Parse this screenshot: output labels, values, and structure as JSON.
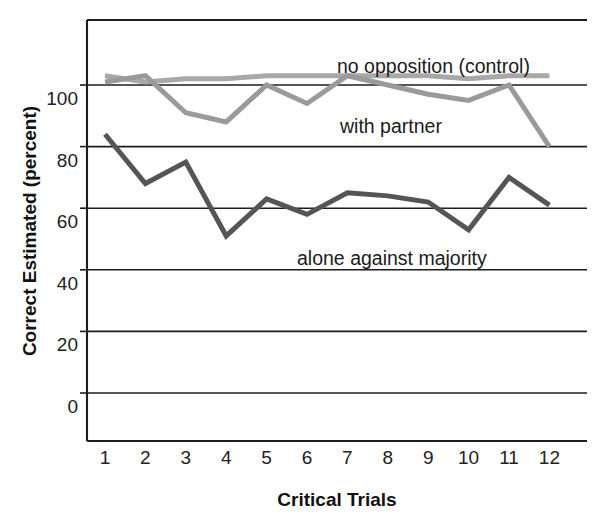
{
  "chart_data": {
    "type": "line",
    "title": "",
    "xlabel": "Critical Trials",
    "ylabel": "Correct Estimated (percent)",
    "x": [
      1,
      2,
      3,
      4,
      5,
      6,
      7,
      8,
      9,
      10,
      11,
      12
    ],
    "xtick_labels": [
      "1",
      "2",
      "3",
      "4",
      "5",
      "6",
      "7",
      "8",
      "9",
      "10",
      "11",
      "12"
    ],
    "ytick_labels": [
      "0",
      "20",
      "40",
      "60",
      "80",
      "100"
    ],
    "yticks": [
      0,
      20,
      40,
      60,
      80,
      100
    ],
    "xlim": [
      0.35,
      12.65
    ],
    "ylim": [
      -14,
      121
    ],
    "grid": true,
    "grid_axis": "y",
    "legend": "inline-annotations",
    "series": [
      {
        "name": "no opposition (control)",
        "color": "#a8a8a8",
        "stroke_width": 5.0,
        "label_text": "no opposition (control)",
        "label_x": 337,
        "label_y": 73,
        "values": [
          103,
          101,
          102,
          102,
          103,
          103,
          103,
          103,
          103,
          102,
          103,
          103
        ]
      },
      {
        "name": "with partner",
        "color": "#9a9a9a",
        "stroke_width": 5.0,
        "label_text": "with partner",
        "label_x": 340,
        "label_y": 133,
        "values": [
          101,
          103,
          91,
          88,
          100,
          94,
          103,
          100,
          97,
          95,
          100,
          80
        ]
      },
      {
        "name": "alone against majority",
        "color": "#555555",
        "stroke_width": 5.0,
        "label_text": "alone against majority",
        "label_x": 297,
        "label_y": 265,
        "values": [
          84,
          68,
          75,
          51,
          63,
          58,
          65,
          64,
          62,
          53,
          70,
          61
        ]
      }
    ],
    "colors": {
      "axis": "#1d1d1d",
      "background": "#ffffff",
      "control_line": "#a8a8a8",
      "partner_line": "#9a9a9a",
      "alone_line": "#555555"
    },
    "geometry": {
      "plot_left": 87,
      "plot_right": 587,
      "plot_top": 20,
      "plot_bottom": 441,
      "y_zero_px": 393,
      "y_unit_px": 3.08,
      "x_first_px": 105,
      "x_step_px": 40.4
    }
  }
}
